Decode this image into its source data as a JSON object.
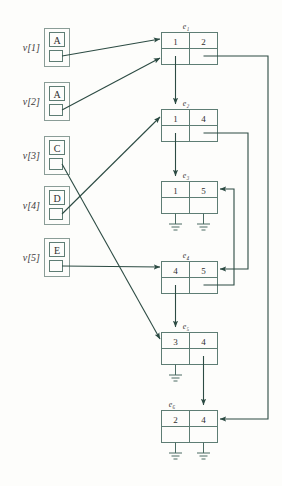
{
  "figure": {
    "colors": {
      "line": "#2c4b43",
      "box_stroke": "#5e7d74",
      "outer_box_stroke": "#8a9d97",
      "text": "#3c3c3c",
      "background": "#fdfdfb"
    }
  },
  "vertex_array": {
    "name": "v",
    "entries": [
      {
        "label": "v[1]",
        "key": "A",
        "pointer_target": "e1"
      },
      {
        "label": "v[2]",
        "key": "A",
        "pointer_target": "e1"
      },
      {
        "label": "v[3]",
        "key": "C",
        "pointer_target": "e5"
      },
      {
        "label": "v[4]",
        "key": "D",
        "pointer_target": "e2"
      },
      {
        "label": "v[5]",
        "key": "E",
        "pointer_target": "e4"
      }
    ]
  },
  "edge_nodes": [
    {
      "id": "e1",
      "label": "e₁",
      "left_value": "1",
      "right_value": "2",
      "left_pointer": "e2",
      "right_pointer": "e6"
    },
    {
      "id": "e2",
      "label": "e₂",
      "left_value": "1",
      "right_value": "4",
      "left_pointer": "e3",
      "right_pointer": "e4"
    },
    {
      "id": "e3",
      "label": "e₃",
      "left_value": "1",
      "right_value": "5",
      "left_pointer": "nil",
      "right_pointer": "nil"
    },
    {
      "id": "e4",
      "label": "e₄",
      "left_value": "4",
      "right_value": "5",
      "left_pointer": "e5",
      "right_pointer": "e3"
    },
    {
      "id": "e5",
      "label": "e₅",
      "left_value": "3",
      "right_value": "4",
      "left_pointer": "nil",
      "right_pointer": "e6"
    },
    {
      "id": "e6",
      "label": "e₆",
      "left_value": "2",
      "right_value": "4",
      "left_pointer": "nil",
      "right_pointer": "nil"
    }
  ],
  "legend": {
    "nil_symbol": "ground",
    "pointer_symbol": "arrow"
  }
}
